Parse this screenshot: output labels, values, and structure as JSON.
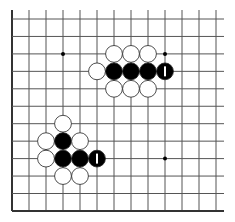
{
  "board": {
    "description": "Go board fragment (bottom-left corner region, left and bottom edges visible)",
    "columns": 13,
    "rows": 12,
    "edges": {
      "left": true,
      "bottom": true,
      "top": false,
      "right": false
    },
    "colors": {
      "background": "#ffffff",
      "line": "#555555",
      "edge": "#333333",
      "black_stone": "#000000",
      "white_stone": "#ffffff",
      "stone_outline": "#222222",
      "marker": "#ffffff"
    },
    "star_points": [
      {
        "col": 3,
        "row": 2
      },
      {
        "col": 9,
        "row": 2
      },
      {
        "col": 3,
        "row": 8
      },
      {
        "col": 9,
        "row": 8
      }
    ],
    "stones": [
      {
        "color": "white",
        "col": 6,
        "row": 2
      },
      {
        "color": "white",
        "col": 7,
        "row": 2
      },
      {
        "color": "white",
        "col": 8,
        "row": 2
      },
      {
        "color": "white",
        "col": 5,
        "row": 3
      },
      {
        "color": "black",
        "col": 6,
        "row": 3
      },
      {
        "color": "black",
        "col": 7,
        "row": 3
      },
      {
        "color": "black",
        "col": 8,
        "row": 3
      },
      {
        "color": "black",
        "col": 9,
        "row": 3,
        "marker": "bar"
      },
      {
        "color": "white",
        "col": 6,
        "row": 4
      },
      {
        "color": "white",
        "col": 7,
        "row": 4
      },
      {
        "color": "white",
        "col": 8,
        "row": 4
      },
      {
        "color": "white",
        "col": 3,
        "row": 6
      },
      {
        "color": "white",
        "col": 2,
        "row": 7
      },
      {
        "color": "black",
        "col": 3,
        "row": 7
      },
      {
        "color": "white",
        "col": 4,
        "row": 7
      },
      {
        "color": "white",
        "col": 2,
        "row": 8
      },
      {
        "color": "black",
        "col": 3,
        "row": 8
      },
      {
        "color": "black",
        "col": 4,
        "row": 8
      },
      {
        "color": "black",
        "col": 5,
        "row": 8,
        "marker": "bar"
      },
      {
        "color": "white",
        "col": 3,
        "row": 9
      },
      {
        "color": "white",
        "col": 4,
        "row": 9
      }
    ]
  }
}
